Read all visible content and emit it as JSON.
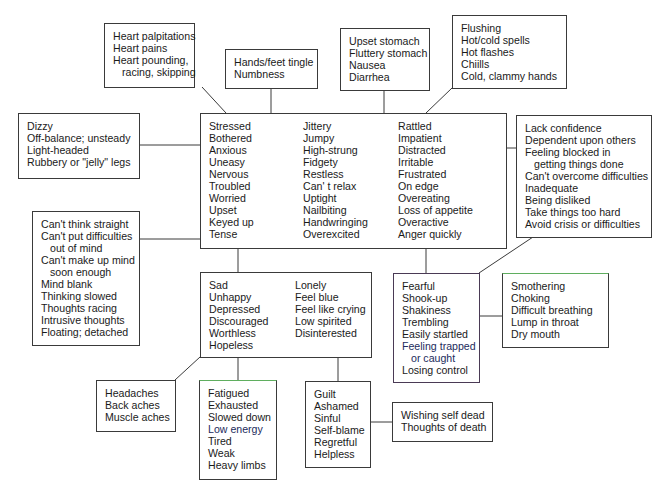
{
  "diagram": {
    "type": "symptom-cluster-map",
    "center": {
      "id": "central",
      "columns": [
        [
          "Stressed",
          "Bothered",
          "Anxious",
          "Uneasy",
          "Nervous",
          "Troubled",
          "Worried",
          "Upset",
          "Keyed up",
          "Tense"
        ],
        [
          "Jittery",
          "Jumpy",
          "High-strung",
          "Fidgety",
          "Restless",
          "Can' t  relax",
          "Uptight",
          "Nailbiting",
          "Handwringing",
          "Overexcited"
        ],
        [
          "Rattled",
          "Impatient",
          "Distracted",
          "Irritable",
          "Frustrated",
          "On edge",
          "Overeating",
          "Loss of appetite",
          "Overactive",
          "Anger quickly"
        ]
      ]
    },
    "heart": {
      "lines": [
        "Heart palpitations",
        "Heart pains",
        "Heart pounding,",
        "racing, skipping"
      ]
    },
    "hands": {
      "lines": [
        "Hands/feet tingle",
        "Numbness"
      ]
    },
    "stomach": {
      "lines": [
        "Upset stomach",
        "Fluttery stomach",
        "Nausea",
        "Diarrhea"
      ]
    },
    "flushing": {
      "lines": [
        "Flushing",
        "Hot/cold spells",
        "Hot flashes",
        "Chiills",
        "Cold,  clammy  hands"
      ]
    },
    "dizzy": {
      "lines": [
        "Dizzy",
        "Off-balance; unsteady",
        "Light-headed",
        "Rubbery or \"jelly\"  legs"
      ]
    },
    "confidence": {
      "lines": [
        "Lack confidence",
        "Dependent  upon others",
        "Feeling blocked in",
        "getting things done",
        "Can't overcome difficulties",
        "Inadequate",
        "Being disliked",
        "Take things too hard",
        "Avoid crisis or difficulties"
      ]
    },
    "thinking": {
      "lines": [
        "Can't think straight",
        "Can't put difficulties",
        "out of mind",
        "Can't make up mind",
        "soon enough",
        "Mind blank",
        "Thinking slowed",
        "Thoughts racing",
        "Intrusive thoughts",
        "Floating; detached"
      ]
    },
    "sad": {
      "columns": [
        [
          "Sad",
          "Unhappy",
          "Depressed",
          "Discouraged",
          "Worthless",
          "Hopeless"
        ],
        [
          "Lonely",
          "Feel blue",
          "Feel like crying",
          "Low spirited",
          "Disinterested"
        ]
      ]
    },
    "fearful": {
      "lines": [
        "Fearful",
        "Shook-up",
        "Shakiness",
        "Trembling",
        "Easily  startled",
        "Feeling trapped",
        "or  caught",
        "Losing control"
      ]
    },
    "smothering": {
      "lines": [
        "Smothering",
        "Choking",
        "Difficult  breathing",
        "Lump in throat",
        "Dry mouth"
      ]
    },
    "aches": {
      "lines": [
        "Headaches",
        "Back aches",
        "Muscle aches"
      ]
    },
    "fatigued": {
      "lines": [
        "Fatigued",
        "Exhausted",
        "Slowed down",
        "Low energy",
        "Tired",
        "Weak",
        "Heavy limbs"
      ]
    },
    "guilt": {
      "lines": [
        "Guilt",
        "Ashamed",
        "Sinful",
        "Self-blame",
        "Regretful",
        "Helpless"
      ]
    },
    "death": {
      "lines": [
        "Wishing self dead",
        "Thoughts of death"
      ]
    }
  }
}
